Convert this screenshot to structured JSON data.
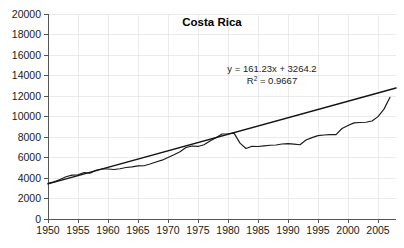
{
  "chart_data": {
    "type": "line",
    "title": "Costa Rica",
    "xlabel": "",
    "ylabel": "",
    "xlim": [
      1950,
      2008
    ],
    "ylim": [
      0,
      20000
    ],
    "grid": true,
    "legend": "none",
    "y_ticks": [
      0,
      2000,
      4000,
      6000,
      8000,
      10000,
      12000,
      14000,
      16000,
      18000,
      20000
    ],
    "y_tick_labels": [
      "0",
      "2000",
      "4000",
      "6000",
      "8000",
      "10000",
      "12000",
      "14000",
      "16000",
      "18000",
      "20000"
    ],
    "x_ticks": [
      1950,
      1955,
      1960,
      1965,
      1970,
      1975,
      1980,
      1985,
      1990,
      1995,
      2000,
      2005
    ],
    "x_tick_labels": [
      "1950",
      "1955",
      "1960",
      "1965",
      "1970",
      "1975",
      "1980",
      "1985",
      "1990",
      "1995",
      "2000",
      "2005"
    ],
    "annotations": {
      "equation": "y = 161.23x + 3264.2",
      "r_squared_prefix": "R",
      "r_squared_sup": "2",
      "r_squared_value": " = 0.9667"
    },
    "series": [
      {
        "name": "Costa Rica observed",
        "x": [
          1950,
          1951,
          1952,
          1953,
          1954,
          1955,
          1956,
          1957,
          1958,
          1959,
          1960,
          1961,
          1962,
          1963,
          1964,
          1965,
          1966,
          1967,
          1968,
          1969,
          1970,
          1971,
          1972,
          1973,
          1974,
          1975,
          1976,
          1977,
          1978,
          1979,
          1980,
          1981,
          1982,
          1983,
          1984,
          1985,
          1986,
          1987,
          1988,
          1989,
          1990,
          1991,
          1992,
          1993,
          1994,
          1995,
          1996,
          1997,
          1998,
          1999,
          2000,
          2001,
          2002,
          2003,
          2004,
          2005,
          2006,
          2007
        ],
        "y": [
          3480,
          3620,
          3850,
          4120,
          4280,
          4310,
          4540,
          4460,
          4760,
          4880,
          4880,
          4830,
          4900,
          5020,
          5090,
          5180,
          5200,
          5370,
          5560,
          5740,
          6000,
          6260,
          6560,
          6970,
          7120,
          7080,
          7240,
          7610,
          7930,
          8290,
          8320,
          8380,
          7400,
          6880,
          7100,
          7070,
          7140,
          7200,
          7220,
          7320,
          7350,
          7310,
          7240,
          7700,
          7940,
          8130,
          8200,
          8230,
          8230,
          8830,
          9130,
          9380,
          9420,
          9440,
          9560,
          9990,
          10720,
          11880
        ]
      },
      {
        "name": "Linear trend",
        "x": [
          1950,
          2008
        ],
        "y": [
          3425,
          12778
        ]
      }
    ]
  },
  "axes": {
    "plot_left": 48,
    "plot_right": 396,
    "plot_top": 14,
    "plot_bottom": 219
  },
  "colors": {
    "background": "#ffffff",
    "grid": "#e2e2e6",
    "axis": "#555555",
    "series": "#1a1a1a",
    "trend": "#141414",
    "text": "#1a1a1a"
  },
  "title_position": {
    "x": 212,
    "y": 26
  },
  "annotation_position": {
    "x": 272,
    "y": 72
  }
}
